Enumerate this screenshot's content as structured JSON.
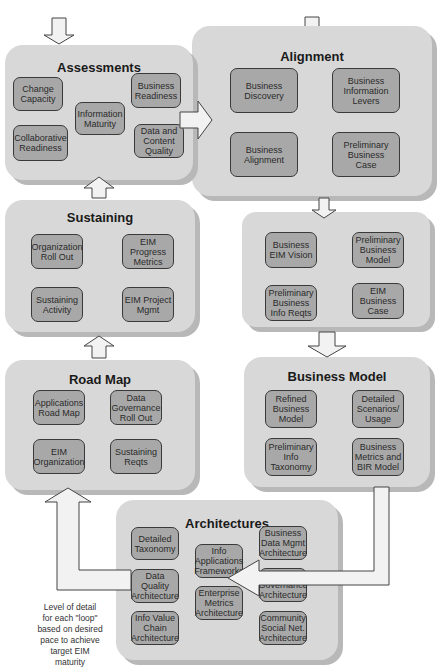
{
  "phases": {
    "assessments": {
      "title": "Assessments",
      "nodes": [
        "Change\nCapacity",
        "Information\nMaturity",
        "Business\nReadiness",
        "Collaborative\nReadiness",
        "Data and\nContent\nQuality"
      ]
    },
    "alignment": {
      "title": "Alignment",
      "nodes": [
        "Business\nDiscovery",
        "Business\nInformation\nLevers",
        "Business\nAlignment",
        "Preliminary\nBusiness\nCase"
      ]
    },
    "vision": {
      "title": "",
      "nodes": [
        "Business\nEIM Vision",
        "Preliminary\nBusiness\nModel",
        "Preliminary\nBusiness\nInfo Reqts",
        "EIM\nBusiness\nCase"
      ]
    },
    "sustaining": {
      "title": "Sustaining",
      "nodes": [
        "Organization\nRoll Out",
        "EIM\nProgress\nMetrics",
        "Sustaining\nActivity",
        "EIM Project\nMgmt"
      ]
    },
    "business_model": {
      "title": "Business Model",
      "nodes": [
        "Refined\nBusiness\nModel",
        "Detailed\nScenarios/\nUsage",
        "Preliminary\nInfo\nTaxonomy",
        "Business\nMetrics and\nBIR Model"
      ]
    },
    "road_map": {
      "title": "Road Map",
      "nodes": [
        "Applications\nRoad Map",
        "Data\nGovernance\nRoll Out",
        "EIM\nOrganization",
        "Sustaining\nReqts"
      ]
    },
    "architectures": {
      "title": "Architectures",
      "nodes": [
        "Detailed\nTaxonomy",
        "Info\nApplications\nFrameworks",
        "Business\nData Mgmt\nArchitecture",
        "Data Quality\nArchitecture",
        "Enterprise\nMetrics\nArchitecture",
        "Data\nGovernance\nArchitecture",
        "Info Value\nChain\nArchitecture",
        "Community\nSocial Net.\nArchitecture"
      ]
    }
  },
  "note": "Level of detail\nfor each \"loop\"\nbased on desired\npace to achieve\ntarget EIM\nmaturity",
  "colors": {
    "panel": "#d8d8d8",
    "node": "#a8a8a8",
    "arrow_fill": "#f2f2f2",
    "arrow_stroke": "#444444"
  }
}
